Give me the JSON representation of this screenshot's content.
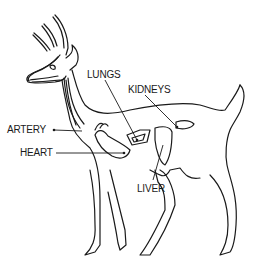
{
  "diagram": {
    "labels": {
      "lungs": "LUNGS",
      "kidneys": "KIDNEYS",
      "artery": "ARTERY",
      "heart": "HEART",
      "liver": "LIVER"
    },
    "colors": {
      "line": "#1a1a1a",
      "background": "#ffffff"
    }
  }
}
